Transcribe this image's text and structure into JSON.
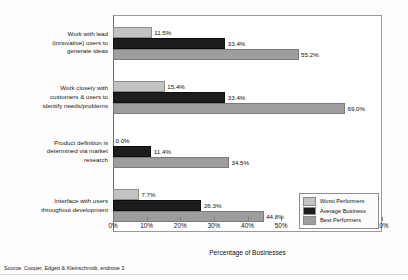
{
  "chart_data": {
    "type": "bar",
    "orientation": "horizontal",
    "title": "",
    "xlabel": "Percentage of Businesses",
    "ylabel": "",
    "xlim": [
      0,
      80
    ],
    "xtick_labels": [
      "0%",
      "10%",
      "20%",
      "30%",
      "40%",
      "50%",
      "60%",
      "70%",
      "80%"
    ],
    "xtick_values": [
      0,
      10,
      20,
      30,
      40,
      50,
      60,
      70,
      80
    ],
    "grid": false,
    "legend_position": "bottom-right-inset",
    "categories": [
      "Work with lead (innovative) users to generate ideas",
      "Work closely with customers & users to identify needs/problems",
      "Product definition is determined via market research",
      "Interface with users throughout development"
    ],
    "series": [
      {
        "name": "Worst Performers",
        "color": "#c2c2c2",
        "values": [
          11.5,
          15.4,
          0.0,
          7.7
        ]
      },
      {
        "name": "Average Business",
        "color": "#1d1d1d",
        "values": [
          33.4,
          33.4,
          11.4,
          26.3
        ]
      },
      {
        "name": "Best Performers",
        "color": "#9d9d9d",
        "values": [
          55.2,
          69.0,
          34.5,
          44.8
        ]
      }
    ],
    "data_labels": [
      [
        "11.5%",
        "33.4%",
        "55.2%"
      ],
      [
        "15.4%",
        "33.4%",
        "69.0%"
      ],
      [
        "0.0%",
        "11.4%",
        "34.5%"
      ],
      [
        "7.7%",
        "26.3%",
        "44.8%"
      ]
    ]
  },
  "category_label_lines": [
    [
      "Work with lead",
      "(innovative) users to",
      "generate ideas"
    ],
    [
      "Work closely with",
      "customers & users to",
      "identify needs/problems"
    ],
    [
      "Product definition is",
      "determined via market",
      "research"
    ],
    [
      "Interface with users",
      "throughout development"
    ]
  ],
  "legend": {
    "items": [
      {
        "label": "Worst Performers",
        "color": "#c2c2c2"
      },
      {
        "label": "Average Business",
        "color": "#1d1d1d"
      },
      {
        "label": "Best Performers",
        "color": "#9d9d9d"
      }
    ]
  },
  "source": {
    "text": "Source: Cooper, Edgett & Kleinschmidt, endnote 3."
  }
}
